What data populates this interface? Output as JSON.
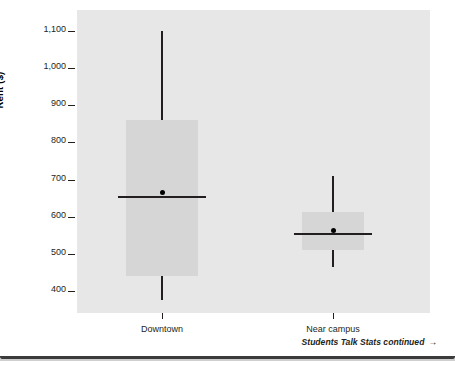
{
  "chart_data": {
    "type": "box",
    "title": "",
    "xlabel": "",
    "ylabel": "Rent ($)",
    "ylim": [
      370,
      1130
    ],
    "yticks": [
      400,
      500,
      600,
      700,
      800,
      900,
      1000,
      1100
    ],
    "ytick_labels": [
      "400",
      "500",
      "600",
      "700",
      "800",
      "900",
      "1,000",
      "1,100"
    ],
    "categories": [
      "Downtown",
      "Near campus"
    ],
    "grid": false,
    "legend": "none",
    "plot_background": "#e7e7e7",
    "box_fill": "#d6d6d6",
    "line_color": "#231f20",
    "boxes": [
      {
        "name": "Downtown",
        "whisker_low": 375,
        "q1": 440,
        "median": 655,
        "q3": 860,
        "whisker_high": 1100,
        "mean": 665
      },
      {
        "name": "Near campus",
        "whisker_low": 465,
        "q1": 510,
        "median": 555,
        "q3": 612,
        "whisker_high": 710,
        "mean": 562
      }
    ]
  },
  "footer": {
    "note": "Students Talk Stats continued",
    "arrow": "→"
  }
}
